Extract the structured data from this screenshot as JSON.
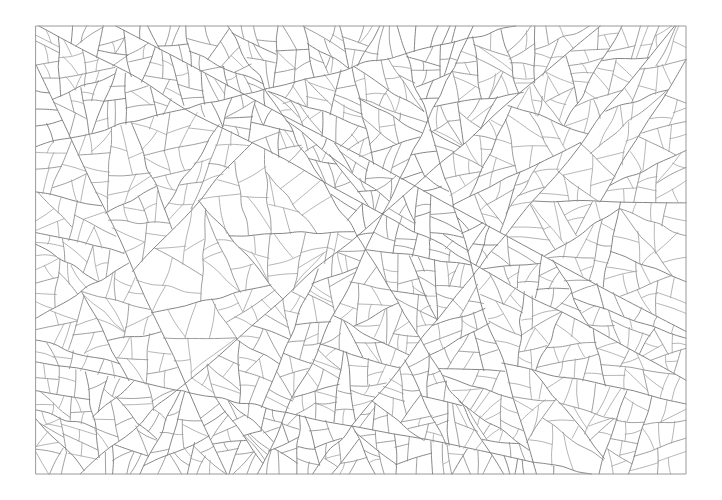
{
  "figure": {
    "kind": "craquelure-line-drawing",
    "background_color": "#ffffff",
    "canvas": {
      "width": 722,
      "height": 500
    }
  },
  "frame": {
    "name": "border-rectangle",
    "x": 36,
    "y": 26,
    "width": 650,
    "height": 448,
    "stroke_color": "#9a9a9a",
    "stroke_width": 1.0
  },
  "strokes": {
    "primary_color": "#7e7e7e",
    "secondary_color": "#8d8d8d",
    "tertiary_color": "#9b9b9b",
    "primary_width": 0.95,
    "secondary_width": 0.85,
    "tertiary_width": 0.75
  },
  "chart_data": {
    "type": "line",
    "xlabel": "",
    "ylabel": "",
    "grid": false,
    "legend": "none",
    "xlim": [
      36,
      686
    ],
    "ylim": [
      26,
      474
    ],
    "generator": {
      "seed": 20240731,
      "cells_target": 430,
      "mean_cell_size_px": 25,
      "subdivision_levels": 3,
      "curvature_jitter": 0.22,
      "vertex_jitter": 0.3
    },
    "cell_size_stats": {
      "min_px": 8,
      "max_px": 62,
      "mean_px": 25,
      "approx_cell_count": 430
    },
    "regions": [
      {
        "name": "upper-left",
        "x": 36,
        "y": 26,
        "width": 215,
        "height": 150,
        "density": "medium",
        "orientation": "radial-fan"
      },
      {
        "name": "upper-center",
        "x": 251,
        "y": 26,
        "width": 215,
        "height": 150,
        "density": "medium",
        "orientation": "arcuate"
      },
      {
        "name": "upper-right",
        "x": 466,
        "y": 26,
        "width": 220,
        "height": 150,
        "density": "high",
        "orientation": "radial-fan"
      },
      {
        "name": "middle-left",
        "x": 36,
        "y": 176,
        "width": 215,
        "height": 149,
        "density": "medium",
        "orientation": "orthogonal"
      },
      {
        "name": "middle-center",
        "x": 251,
        "y": 176,
        "width": 215,
        "height": 149,
        "density": "high",
        "orientation": "arcuate"
      },
      {
        "name": "middle-right",
        "x": 466,
        "y": 176,
        "width": 220,
        "height": 149,
        "density": "high",
        "orientation": "radial-fan"
      },
      {
        "name": "lower-left",
        "x": 36,
        "y": 325,
        "width": 215,
        "height": 149,
        "density": "medium",
        "orientation": "diagonal"
      },
      {
        "name": "lower-center",
        "x": 251,
        "y": 325,
        "width": 215,
        "height": 149,
        "density": "medium",
        "orientation": "diagonal"
      },
      {
        "name": "lower-right",
        "x": 466,
        "y": 325,
        "width": 220,
        "height": 149,
        "density": "medium",
        "orientation": "arcuate"
      }
    ]
  }
}
